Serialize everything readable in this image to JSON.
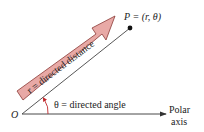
{
  "diagram": {
    "origin_label": "O",
    "point_label": "P = (r, θ)",
    "distance_label": "r = directed distance",
    "angle_label": "θ = directed angle",
    "axis_label_line1": "Polar",
    "axis_label_line2": "axis",
    "colors": {
      "arrow_fill": "#e8a9a6",
      "arrow_stroke": "#8a3a36",
      "line": "#333333",
      "angle_arc": "#c0282c",
      "text": "#222222"
    }
  }
}
